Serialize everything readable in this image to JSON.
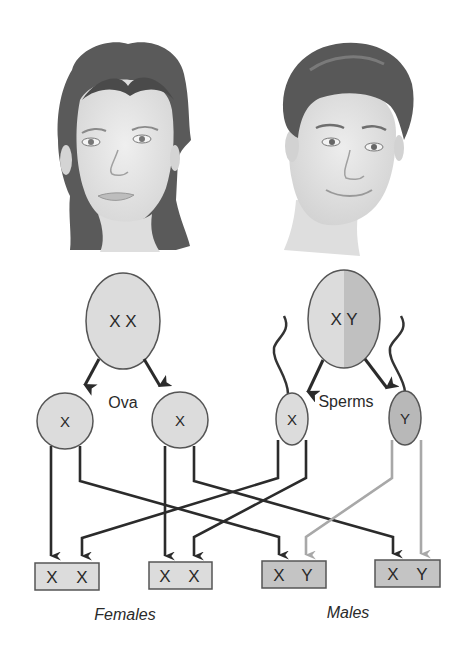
{
  "diagram": {
    "colors": {
      "cell_fill": "#dcdcdc",
      "cell_fill_dark": "#bdbdbd",
      "outline": "#555555",
      "arrow_dark": "#2b2b2b",
      "arrow_light": "#a8a8a8",
      "female_box_fill": "#dcdcdc",
      "male_box_fill": "#c4c4c4",
      "hair": "#4a4a4a",
      "skin": "#e6e6e6"
    },
    "parents": {
      "female": {
        "label": "female-portrait",
        "cell_label": "X X"
      },
      "male": {
        "label": "male-portrait",
        "cell_label": "X Y"
      }
    },
    "gametes": {
      "ova_label": "Ova",
      "sperms_label": "Sperms",
      "ova": [
        {
          "label": "X"
        },
        {
          "label": "X"
        }
      ],
      "sperms": [
        {
          "label": "X"
        },
        {
          "label": "Y"
        }
      ]
    },
    "offspring": [
      {
        "a": "X",
        "b": "X",
        "sex": "female"
      },
      {
        "a": "X",
        "b": "X",
        "sex": "female"
      },
      {
        "a": "X",
        "b": "Y",
        "sex": "male"
      },
      {
        "a": "X",
        "b": "Y",
        "sex": "male"
      }
    ],
    "captions": {
      "females": "Females",
      "males": "Males"
    }
  }
}
